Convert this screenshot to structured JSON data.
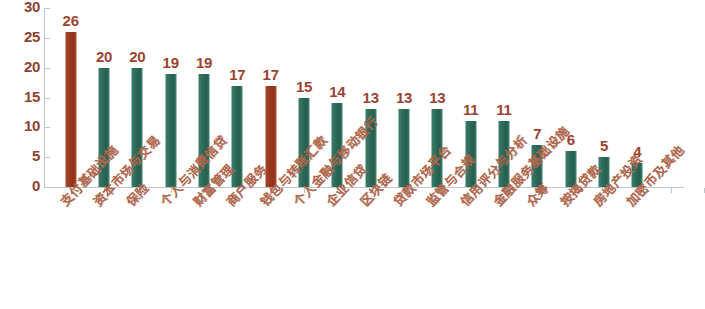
{
  "chart_data": {
    "type": "bar",
    "title": "",
    "subtitle": "",
    "xlabel": "",
    "ylabel": "",
    "ylim": [
      0,
      30
    ],
    "y_ticks": [
      0,
      5,
      10,
      15,
      20,
      25,
      30
    ],
    "grid": false,
    "legend": "none",
    "categories": [
      "支付基础设施",
      "资本市场与交易",
      "保险",
      "个人与消费信贷",
      "财富管理",
      "商户服务",
      "钱包与转账汇款",
      "个人金融与移动银行",
      "企业信贷",
      "区块链",
      "贷款市场平台",
      "监管与合规",
      "信用评分与分析",
      "金融服务基础设施",
      "众筹",
      "按揭贷款",
      "房地产投资",
      "加密币及其他"
    ],
    "values": [
      26,
      20,
      20,
      19,
      19,
      17,
      17,
      15,
      14,
      13,
      13,
      13,
      11,
      11,
      7,
      6,
      5,
      4
    ],
    "bar_colors": [
      "red",
      "green",
      "green",
      "green",
      "green",
      "green",
      "red",
      "green",
      "green",
      "green",
      "green",
      "green",
      "green",
      "green",
      "green",
      "green",
      "green",
      "green"
    ],
    "colors": {
      "highlight_bar": "#99381c",
      "default_bar": "#2d6a58",
      "data_label": "#9b4330",
      "axis_label": "#8e4430",
      "category_label": "#b0684e",
      "axis_line": "#b9c6cf",
      "background": "#ffffff"
    }
  }
}
